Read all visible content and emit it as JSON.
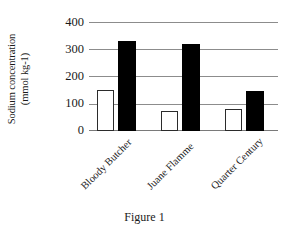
{
  "chart_data": {
    "type": "bar",
    "title": "",
    "caption": "Figure 1",
    "xlabel": "",
    "ylabel": "Sodium concentration\n(mmol kg-1)",
    "ylim": [
      0,
      400
    ],
    "yticks": [
      400,
      300,
      200,
      100,
      0
    ],
    "ytick_labels": [
      "400",
      "300",
      "200",
      "100",
      "0"
    ],
    "grid": true,
    "legend": "none",
    "categories": [
      "Bloody Butcher",
      "Juane Flamme",
      "Quarter Century"
    ],
    "series": [
      {
        "name": "white-bar-series",
        "style": "white-filled-black-outline",
        "color": "#ffffff",
        "edge_color": "#2b2b2b",
        "values": [
          152,
          75,
          82
        ]
      },
      {
        "name": "black-bar-series",
        "style": "black-filled",
        "color": "#000000",
        "edge_color": "#000000",
        "values": [
          332,
          320,
          148
        ]
      }
    ]
  }
}
